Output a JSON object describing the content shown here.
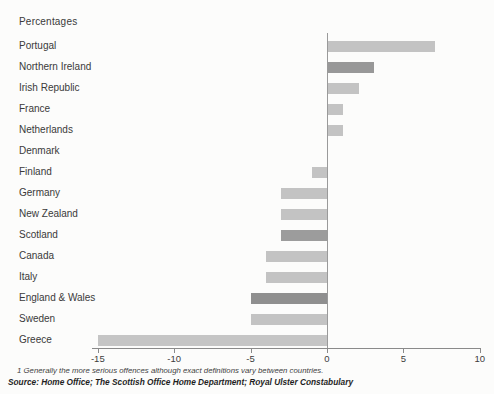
{
  "title": "Percentages",
  "chart_data": {
    "type": "bar",
    "orientation": "horizontal",
    "title": "Percentages",
    "categories": [
      "Portugal",
      "Northern Ireland",
      "Irish Republic",
      "France",
      "Netherlands",
      "Denmark",
      "Finland",
      "Germany",
      "New Zealand",
      "Scotland",
      "Canada",
      "Italy",
      "England & Wales",
      "Sweden",
      "Greece"
    ],
    "values": [
      7,
      3,
      2,
      1,
      1,
      0,
      -1,
      -3,
      -3,
      -3,
      -4,
      -4,
      -5,
      -5,
      -15
    ],
    "bar_colors": [
      "#c3c3c3",
      "#989898",
      "#c3c3c3",
      "#c3c3c3",
      "#c3c3c3",
      "#c3c3c3",
      "#c3c3c3",
      "#c3c3c3",
      "#c3c3c3",
      "#9c9c9c",
      "#c3c3c3",
      "#c3c3c3",
      "#8f8f8f",
      "#c3c3c3",
      "#c5c5c5"
    ],
    "xticks": [
      -15,
      -10,
      -5,
      0,
      5,
      10
    ],
    "xlim": [
      -15.4,
      10.1
    ],
    "grid": false,
    "legend": false
  },
  "footnote": "1  Generally the more serious offences although exact definitions vary between countries.",
  "source": "Source: Home Office; The Scottish Office Home Department; Royal Ulster Constabulary"
}
